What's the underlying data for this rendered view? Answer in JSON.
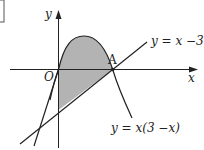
{
  "diagram": {
    "axes": {
      "x_label": "x",
      "y_label": "y",
      "origin_label": "O"
    },
    "points": [
      {
        "name": "A",
        "x": 3,
        "y": 0
      }
    ],
    "curves": [
      {
        "name": "parabola",
        "equation": "y = x(3 −x)"
      },
      {
        "name": "line",
        "equation": "y = x −3"
      },
      {
        "name": "tangent",
        "equation": "y = 3x"
      }
    ],
    "shaded_region": "area between y = x(3−x) and y = x−3 for 0 ≤ x ≤ 3",
    "colors": {
      "shade": "#b3b3b3",
      "stroke": "#222222"
    }
  }
}
